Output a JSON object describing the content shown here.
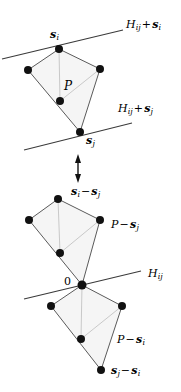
{
  "figure": {
    "background_color": "#ffffff",
    "stroke_color": "#3a3a3a",
    "polygon_fill": "#f4f4f4",
    "point_color": "#111111",
    "width": 181,
    "height": 392
  },
  "top_diagram": {
    "name": "translated-polygon-between-two-parallel-hyperplanes",
    "polygon_label": "P",
    "hyperplane_upper_label": {
      "base": "H",
      "base_sub": "ij",
      "operator": "+",
      "term": "s",
      "term_sub": "i",
      "text": "H_ij + s_i"
    },
    "hyperplane_lower_label": {
      "base": "H",
      "base_sub": "ij",
      "operator": "+",
      "term": "s",
      "term_sub": "j",
      "text": "H_ij + s_j"
    },
    "vertex_label_top": {
      "term": "s",
      "term_sub": "i",
      "text": "s_i"
    },
    "vertex_label_bottom": {
      "term": "s",
      "term_sub": "j",
      "text": "s_j"
    },
    "vertices": [
      {
        "x": 59,
        "y": 49,
        "name": "vertex-s-i"
      },
      {
        "x": 28,
        "y": 70,
        "name": "vertex-left"
      },
      {
        "x": 80,
        "y": 132,
        "name": "vertex-s-j"
      },
      {
        "x": 100,
        "y": 69,
        "name": "vertex-right"
      }
    ],
    "interior_point": {
      "x": 60,
      "y": 101,
      "name": "interior-point"
    },
    "upper_line": {
      "x1": 2,
      "y1": 59,
      "x2": 123,
      "y2": 30
    },
    "lower_line": {
      "x1": 24,
      "y1": 150,
      "x2": 132,
      "y2": 123
    }
  },
  "arrow": {
    "name": "double-headed-vertical-arrow",
    "x": 78,
    "y_top": 156,
    "y_bottom": 181
  },
  "bottom_diagram": {
    "name": "minkowski-difference-two-polygons-through-origin",
    "origin_label": "0",
    "hyperplane_label": {
      "base": "H",
      "base_sub": "ij",
      "text": "H_ij"
    },
    "upper_polygon_label": {
      "base": "P",
      "operator": "−",
      "term": "s",
      "term_sub": "j",
      "text": "P − s_j"
    },
    "lower_polygon_label": {
      "base": "P",
      "operator": "−",
      "term": "s",
      "term_sub": "i",
      "text": "P − s_i"
    },
    "upper_vertex_label": {
      "term1": "s",
      "term1_sub": "i",
      "operator": "−",
      "term2": "s",
      "term2_sub": "j",
      "text": "s_i − s_j"
    },
    "lower_vertex_label": {
      "term1": "s",
      "term1_sub": "j",
      "operator": "−",
      "term2": "s",
      "term2_sub": "i",
      "text": "s_j − s_i"
    },
    "upper_polygon_vertices": [
      {
        "x": 58,
        "y": 199,
        "name": "vertex-si-minus-sj"
      },
      {
        "x": 29,
        "y": 220,
        "name": "vertex-left"
      },
      {
        "x": 82,
        "y": 285,
        "name": "vertex-origin"
      },
      {
        "x": 100,
        "y": 220,
        "name": "vertex-right"
      }
    ],
    "upper_interior_point": {
      "x": 60,
      "y": 253,
      "name": "interior-point"
    },
    "lower_polygon_vertices": [
      {
        "x": 82,
        "y": 285,
        "name": "vertex-origin"
      },
      {
        "x": 51,
        "y": 306,
        "name": "vertex-left"
      },
      {
        "x": 101,
        "y": 370,
        "name": "vertex-sj-minus-si"
      },
      {
        "x": 122,
        "y": 306,
        "name": "vertex-right"
      }
    ],
    "lower_interior_point": {
      "x": 81,
      "y": 339,
      "name": "interior-point"
    },
    "hyperplane_line": {
      "x1": 24,
      "y1": 299,
      "x2": 141,
      "y2": 271
    }
  }
}
